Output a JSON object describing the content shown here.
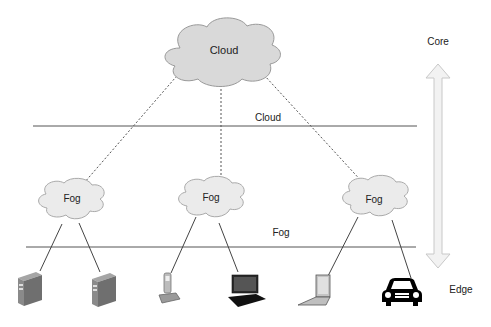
{
  "diagram": {
    "type": "cloud-fog-edge-architecture",
    "top_node": {
      "label": "Cloud"
    },
    "fog_nodes": [
      {
        "label": "Fog",
        "devices": [
          "server",
          "server"
        ]
      },
      {
        "label": "Fog",
        "devices": [
          "phone",
          "laptop-dark"
        ]
      },
      {
        "label": "Fog",
        "devices": [
          "laptop-light",
          "car"
        ]
      }
    ],
    "layers": [
      {
        "label": "Cloud"
      },
      {
        "label": "Fog"
      }
    ],
    "axis": {
      "top_label": "Core",
      "bottom_label": "Edge"
    },
    "colors": {
      "cloud_fill": "#d9d9d9",
      "fog_fill": "#ebebeb",
      "line": "#555555",
      "arrow_fill": "#f2f2f2",
      "arrow_stroke": "#c8c8c8"
    }
  }
}
